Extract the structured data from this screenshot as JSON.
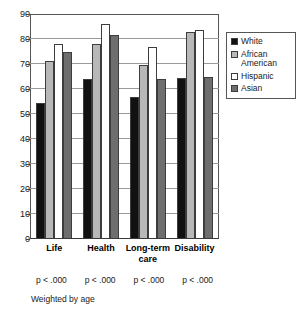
{
  "chart_data": {
    "type": "bar",
    "title": "",
    "subtitle": "",
    "xlabel": "",
    "ylabel": "",
    "ylim": [
      0,
      90
    ],
    "yticks": [
      0,
      10,
      20,
      30,
      40,
      50,
      60,
      70,
      80,
      90
    ],
    "grid": true,
    "legend_position": "right",
    "categories": [
      "Life",
      "Health",
      "Long-term\ncare",
      "Disability"
    ],
    "series": [
      {
        "name": "White",
        "color": "#111111",
        "values": [
          54.5,
          64.0,
          57.0,
          64.5
        ]
      },
      {
        "name": "African American",
        "color": "#b8b8b8",
        "values": [
          71.5,
          78.5,
          70.0,
          83.0
        ]
      },
      {
        "name": "Hispanic",
        "color": "#ffffff",
        "values": [
          78.5,
          86.5,
          77.0,
          84.0
        ]
      },
      {
        "name": "Asian",
        "color": "#6e6e6e",
        "values": [
          75.0,
          82.0,
          64.0,
          65.0
        ]
      }
    ],
    "annotations": [
      "p < .000",
      "p < .000",
      "p < .000",
      "p < .000"
    ],
    "footnote": "Weighted by age"
  },
  "legend": {
    "items": [
      {
        "label": "White"
      },
      {
        "label": "African American"
      },
      {
        "label": "Hispanic"
      },
      {
        "label": "Asian"
      }
    ]
  },
  "axis": {
    "y_labels": [
      "90",
      "80",
      "70",
      "60",
      "50",
      "40",
      "30",
      "20",
      "10",
      "0"
    ]
  }
}
